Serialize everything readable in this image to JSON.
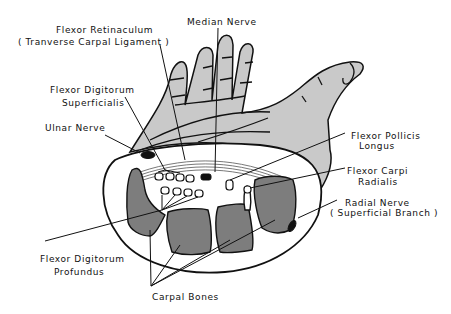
{
  "diagram": {
    "colors": {
      "skin": "#c9c9c9",
      "bone": "#7d7d7d",
      "nerve": "#111111",
      "outline": "#111111",
      "background": "#ffffff"
    },
    "labels": {
      "flexor_retinaculum_1": "Flexor Retinaculum",
      "flexor_retinaculum_2": "( Tranverse Carpal Ligament )",
      "median_nerve": "Median Nerve",
      "fds_1": "Flexor Digitorum",
      "fds_2": "Superficialis",
      "ulnar_nerve": "Ulnar Nerve",
      "fpl_1": "Flexor Pollicis",
      "fpl_2": "Longus",
      "fcr_1": "Flexor Carpi",
      "fcr_2": "Radialis",
      "radial_nerve_1": "Radial Nerve",
      "radial_nerve_2": "( Superficial Branch )",
      "fdp_1": "Flexor Digitorum",
      "fdp_2": "Profundus",
      "carpal_bones": "Carpal Bones"
    }
  }
}
